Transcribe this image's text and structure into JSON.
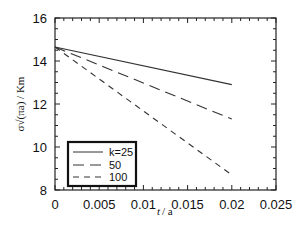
{
  "chart_data": {
    "type": "line",
    "title": "",
    "xlabel": "t / a",
    "ylabel": "σ√(πa) / Km",
    "xlim": [
      0,
      0.025
    ],
    "ylim": [
      8,
      16
    ],
    "xticks": [
      "0",
      "0.005",
      "0.01",
      "0.015",
      "0.02",
      "0.025"
    ],
    "yticks": [
      "8",
      "10",
      "12",
      "14",
      "16"
    ],
    "grid": false,
    "legend_position": "lower left",
    "series": [
      {
        "name": "k=25",
        "style": "solid",
        "x": [
          0,
          0.02
        ],
        "y": [
          14.65,
          12.9
        ]
      },
      {
        "name": "50",
        "style": "long-dash",
        "x": [
          0,
          0.02
        ],
        "y": [
          14.65,
          11.3
        ]
      },
      {
        "name": "100",
        "style": "short-dash",
        "x": [
          0,
          0.02
        ],
        "y": [
          14.65,
          8.7
        ]
      }
    ]
  },
  "labels": {
    "xlabel_main": "t",
    "xlabel_sub": "/ a",
    "ylabel": "σ√(πa) / Km",
    "legend": [
      "k=25",
      "50",
      "100"
    ]
  }
}
